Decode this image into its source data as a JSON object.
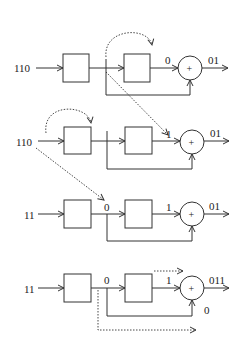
{
  "diagram": {
    "rows": [
      {
        "input": "110",
        "mid_label": "",
        "reg_out": "0",
        "adder": "+",
        "output": "01",
        "feedback_label": ""
      },
      {
        "input": "110",
        "mid_label": "1",
        "reg_out": "1",
        "adder": "+",
        "output": "01",
        "feedback_label": ""
      },
      {
        "input": "11",
        "mid_label": "0",
        "reg_out": "1",
        "adder": "+",
        "output": "01",
        "feedback_label": ""
      },
      {
        "input": "11",
        "mid_label": "0",
        "reg_out": "1",
        "adder": "+",
        "output": "011",
        "feedback_label": "0"
      }
    ]
  }
}
